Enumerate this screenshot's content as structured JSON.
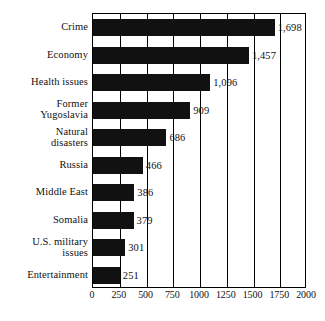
{
  "chart_data": {
    "type": "bar",
    "orientation": "horizontal",
    "title": "",
    "subtitle": "",
    "xlabel": "",
    "ylabel": "",
    "categories": [
      "Crime",
      "Economy",
      "Health issues",
      "Former\nYugoslavia",
      "Natural\ndisasters",
      "Russia",
      "Middle East",
      "Somalia",
      "U.S. military\nissues",
      "Entertainment"
    ],
    "values": [
      1698,
      1457,
      1096,
      909,
      686,
      466,
      386,
      379,
      301,
      251
    ],
    "value_labels": [
      "1,698",
      "1,457",
      "1,096",
      "909",
      "686",
      "466",
      "386",
      "379",
      "301",
      "251"
    ],
    "xlim": [
      0,
      2000
    ],
    "xticks": [
      0,
      250,
      500,
      750,
      1000,
      1250,
      1500,
      1750,
      2000
    ],
    "xtick_labels": [
      "0",
      "250",
      "500",
      "750",
      "1000",
      "1250",
      "1500",
      "1750",
      "2000"
    ],
    "grid": "vertical",
    "legend": "none",
    "bar_color": "#111111",
    "background_color": "#ffffff",
    "axis_color": "#000000"
  },
  "categories": [
    {
      "label_line1": "Crime",
      "label_line2": "",
      "value_label": "1,698"
    },
    {
      "label_line1": "Economy",
      "label_line2": "",
      "value_label": "1,457"
    },
    {
      "label_line1": "Health issues",
      "label_line2": "",
      "value_label": "1,096"
    },
    {
      "label_line1": "Former",
      "label_line2": "Yugoslavia",
      "value_label": "909"
    },
    {
      "label_line1": "Natural",
      "label_line2": "disasters",
      "value_label": "686"
    },
    {
      "label_line1": "Russia",
      "label_line2": "",
      "value_label": "466"
    },
    {
      "label_line1": "Middle East",
      "label_line2": "",
      "value_label": "386"
    },
    {
      "label_line1": "Somalia",
      "label_line2": "",
      "value_label": "379"
    },
    {
      "label_line1": "U.S. military",
      "label_line2": "issues",
      "value_label": "301"
    },
    {
      "label_line1": "Entertainment",
      "label_line2": "",
      "value_label": "251"
    }
  ],
  "xticks": [
    {
      "label": "0"
    },
    {
      "label": "250"
    },
    {
      "label": "500"
    },
    {
      "label": "750"
    },
    {
      "label": "1000"
    },
    {
      "label": "1250"
    },
    {
      "label": "1500"
    },
    {
      "label": "1750"
    },
    {
      "label": "2000"
    }
  ]
}
